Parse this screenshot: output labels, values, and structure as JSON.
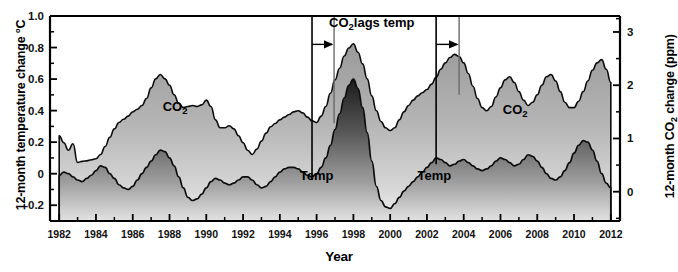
{
  "chart_data": {
    "type": "area",
    "title": "",
    "xlabel": "Year",
    "ylabel_left": "12-month temperature change °C",
    "ylabel_right": "12-month CO  change (ppm)",
    "ylabel_right_sub": "2",
    "xlim": [
      1981.5,
      2012.5
    ],
    "ylim_left": [
      -0.3,
      1.0
    ],
    "ylim_right": [
      -0.55,
      3.3
    ],
    "grid": false,
    "legend_position": "inline-annotations",
    "xticks": [
      1982,
      1984,
      1986,
      1988,
      1990,
      1992,
      1994,
      1996,
      1998,
      2000,
      2002,
      2004,
      2006,
      2008,
      2010,
      2012
    ],
    "xtick_labels": [
      "1982",
      "1984",
      "1986",
      "1988",
      "1990",
      "1992",
      "1994",
      "1996",
      "1998",
      "2000",
      "2002",
      "2004",
      "2006",
      "2008",
      "2010",
      "2012"
    ],
    "yticks_left": [
      -0.2,
      0,
      0.2,
      0.4,
      0.6,
      0.8,
      1.0
    ],
    "ytick_labels_left": [
      "-0.2",
      "0",
      "0.2",
      "0.4",
      "0.6",
      "0.8",
      "1.0"
    ],
    "yticks_right": [
      0,
      1,
      2,
      3
    ],
    "ytick_labels_right": [
      "0",
      "1",
      "2",
      "3"
    ],
    "annotations": [
      {
        "name": "co2-lags-temp",
        "text": "CO  lags temp",
        "sub": "2",
        "x": 1999.0,
        "y_left": 0.93
      },
      {
        "name": "series-label-co2-left",
        "text": "CO",
        "sub": "2",
        "x": 1988.3,
        "y_left": 0.4
      },
      {
        "name": "series-label-co2-right",
        "text": "CO",
        "sub": "2",
        "x": 2006.8,
        "y_left": 0.38
      },
      {
        "name": "series-label-temp-left",
        "text": "Temp",
        "x": 1996.0,
        "y_left": -0.04
      },
      {
        "name": "series-label-temp-right",
        "text": "Temp",
        "x": 2002.4,
        "y_left": -0.04
      }
    ],
    "marker_lines": [
      {
        "name": "lag-marker-temp-1996",
        "x": 1995.75,
        "y_top": 1.0,
        "y_bottom": -0.04,
        "color": "#000000",
        "width": 1.6
      },
      {
        "name": "lag-marker-co2-1996",
        "x": 1996.95,
        "y_top": 1.0,
        "y_bottom": 0.32,
        "color": "#6a6a6a",
        "width": 1.4
      },
      {
        "name": "lag-marker-temp-2002",
        "x": 2002.5,
        "y_top": 1.0,
        "y_bottom": 0.06,
        "color": "#000000",
        "width": 1.6
      },
      {
        "name": "lag-marker-co2-2002",
        "x": 2003.75,
        "y_top": 1.0,
        "y_bottom": 0.5,
        "color": "#6a6a6a",
        "width": 1.4
      }
    ],
    "lag_arrows": [
      {
        "name": "lag-arrow-1996",
        "x_start": 1995.75,
        "x_end": 1996.95,
        "y_left": 0.82
      },
      {
        "name": "lag-arrow-2002",
        "x_start": 2002.5,
        "x_end": 2003.75,
        "y_left": 0.82
      }
    ],
    "series": [
      {
        "name": "CO2",
        "label": "CO2",
        "axis": "right",
        "units": "ppm",
        "fill": "gradient-gray",
        "x": [
          1982.0,
          1982.25,
          1982.5,
          1982.75,
          1983.0,
          1983.25,
          1983.5,
          1983.75,
          1984.0,
          1984.25,
          1984.5,
          1984.75,
          1985.0,
          1985.25,
          1985.5,
          1985.75,
          1986.0,
          1986.25,
          1986.5,
          1986.75,
          1987.0,
          1987.25,
          1987.5,
          1987.75,
          1988.0,
          1988.25,
          1988.5,
          1988.75,
          1989.0,
          1989.25,
          1989.5,
          1989.75,
          1990.0,
          1990.25,
          1990.5,
          1990.75,
          1991.0,
          1991.25,
          1991.5,
          1991.75,
          1992.0,
          1992.25,
          1992.5,
          1992.75,
          1993.0,
          1993.25,
          1993.5,
          1993.75,
          1994.0,
          1994.25,
          1994.5,
          1994.75,
          1995.0,
          1995.25,
          1995.5,
          1995.75,
          1996.0,
          1996.25,
          1996.5,
          1996.75,
          1997.0,
          1997.25,
          1997.5,
          1997.75,
          1998.0,
          1998.25,
          1998.5,
          1998.75,
          1999.0,
          1999.25,
          1999.5,
          1999.75,
          2000.0,
          2000.25,
          2000.5,
          2000.75,
          2001.0,
          2001.25,
          2001.5,
          2001.75,
          2002.0,
          2002.25,
          2002.5,
          2002.75,
          2003.0,
          2003.25,
          2003.5,
          2003.75,
          2004.0,
          2004.25,
          2004.5,
          2004.75,
          2005.0,
          2005.25,
          2005.5,
          2005.75,
          2006.0,
          2006.25,
          2006.5,
          2006.75,
          2007.0,
          2007.25,
          2007.5,
          2007.75,
          2008.0,
          2008.25,
          2008.5,
          2008.75,
          2009.0,
          2009.25,
          2009.5,
          2009.75,
          2010.0,
          2010.25,
          2010.5,
          2010.75,
          2011.0,
          2011.25,
          2011.5,
          2011.75,
          2012.0
        ],
        "values_ppm": [
          1.05,
          0.92,
          0.78,
          0.9,
          0.55,
          0.57,
          0.58,
          0.6,
          0.62,
          0.7,
          0.85,
          1.02,
          1.18,
          1.3,
          1.36,
          1.42,
          1.5,
          1.55,
          1.62,
          1.75,
          1.95,
          2.12,
          2.2,
          2.12,
          2.0,
          1.82,
          1.66,
          1.58,
          1.6,
          1.62,
          1.6,
          1.63,
          1.72,
          1.6,
          1.35,
          1.2,
          1.2,
          1.24,
          1.18,
          1.05,
          0.92,
          0.78,
          0.7,
          0.8,
          0.95,
          1.1,
          1.22,
          1.28,
          1.35,
          1.4,
          1.45,
          1.5,
          1.52,
          1.48,
          1.4,
          1.33,
          1.3,
          1.42,
          1.6,
          1.85,
          2.1,
          2.32,
          2.55,
          2.7,
          2.78,
          2.62,
          2.4,
          2.12,
          1.8,
          1.52,
          1.32,
          1.2,
          1.15,
          1.2,
          1.35,
          1.5,
          1.62,
          1.72,
          1.8,
          1.86,
          1.92,
          2.02,
          2.15,
          2.3,
          2.42,
          2.52,
          2.58,
          2.54,
          2.42,
          2.22,
          1.98,
          1.75,
          1.58,
          1.52,
          1.6,
          1.78,
          1.95,
          2.1,
          2.16,
          2.05,
          1.88,
          1.72,
          1.62,
          1.68,
          1.82,
          2.0,
          2.16,
          2.2,
          2.08,
          1.88,
          1.68,
          1.58,
          1.58,
          1.7,
          1.88,
          2.08,
          2.28,
          2.42,
          2.48,
          2.3,
          2.05
        ]
      },
      {
        "name": "Temp",
        "label": "Temp",
        "axis": "left",
        "units": "°C",
        "fill": "gradient-dark",
        "x": [
          1982.0,
          1982.25,
          1982.5,
          1982.75,
          1983.0,
          1983.25,
          1983.5,
          1983.75,
          1984.0,
          1984.25,
          1984.5,
          1984.75,
          1985.0,
          1985.25,
          1985.5,
          1985.75,
          1986.0,
          1986.25,
          1986.5,
          1986.75,
          1987.0,
          1987.25,
          1987.5,
          1987.75,
          1988.0,
          1988.25,
          1988.5,
          1988.75,
          1989.0,
          1989.25,
          1989.5,
          1989.75,
          1990.0,
          1990.25,
          1990.5,
          1990.75,
          1991.0,
          1991.25,
          1991.5,
          1991.75,
          1992.0,
          1992.25,
          1992.5,
          1992.75,
          1993.0,
          1993.25,
          1993.5,
          1993.75,
          1994.0,
          1994.25,
          1994.5,
          1994.75,
          1995.0,
          1995.25,
          1995.5,
          1995.75,
          1996.0,
          1996.25,
          1996.5,
          1996.75,
          1997.0,
          1997.25,
          1997.5,
          1997.75,
          1998.0,
          1998.25,
          1998.5,
          1998.75,
          1999.0,
          1999.25,
          1999.5,
          1999.75,
          2000.0,
          2000.25,
          2000.5,
          2000.75,
          2001.0,
          2001.25,
          2001.5,
          2001.75,
          2002.0,
          2002.25,
          2002.5,
          2002.75,
          2003.0,
          2003.25,
          2003.5,
          2003.75,
          2004.0,
          2004.25,
          2004.5,
          2004.75,
          2005.0,
          2005.25,
          2005.5,
          2005.75,
          2006.0,
          2006.25,
          2006.5,
          2006.75,
          2007.0,
          2007.25,
          2007.5,
          2007.75,
          2008.0,
          2008.25,
          2008.5,
          2008.75,
          2009.0,
          2009.25,
          2009.5,
          2009.75,
          2010.0,
          2010.25,
          2010.5,
          2010.75,
          2011.0,
          2011.25,
          2011.5,
          2011.75,
          2012.0
        ],
        "values_degC": [
          -0.01,
          0.01,
          0.0,
          -0.02,
          -0.04,
          -0.05,
          -0.03,
          -0.01,
          0.02,
          0.05,
          0.04,
          0.0,
          -0.03,
          -0.07,
          -0.09,
          -0.1,
          -0.08,
          -0.04,
          0.0,
          0.04,
          0.08,
          0.12,
          0.15,
          0.14,
          0.1,
          0.05,
          -0.02,
          -0.09,
          -0.15,
          -0.17,
          -0.16,
          -0.13,
          -0.09,
          -0.05,
          -0.03,
          -0.04,
          -0.06,
          -0.07,
          -0.06,
          -0.04,
          -0.02,
          -0.02,
          -0.04,
          -0.07,
          -0.09,
          -0.08,
          -0.05,
          -0.02,
          0.01,
          0.03,
          0.04,
          0.04,
          0.03,
          0.01,
          -0.01,
          -0.02,
          0.0,
          0.04,
          0.1,
          0.18,
          0.28,
          0.38,
          0.48,
          0.56,
          0.6,
          0.54,
          0.42,
          0.26,
          0.08,
          -0.08,
          -0.17,
          -0.21,
          -0.22,
          -0.19,
          -0.15,
          -0.11,
          -0.08,
          -0.05,
          -0.02,
          0.01,
          0.04,
          0.07,
          0.1,
          0.09,
          0.07,
          0.05,
          0.06,
          0.08,
          0.09,
          0.07,
          0.05,
          0.03,
          0.02,
          0.03,
          0.05,
          0.08,
          0.1,
          0.09,
          0.07,
          0.05,
          0.06,
          0.09,
          0.12,
          0.11,
          0.08,
          0.04,
          0.0,
          -0.03,
          -0.04,
          -0.02,
          0.02,
          0.07,
          0.13,
          0.18,
          0.21,
          0.2,
          0.15,
          0.08,
          0.0,
          -0.06,
          -0.09
        ]
      }
    ]
  }
}
